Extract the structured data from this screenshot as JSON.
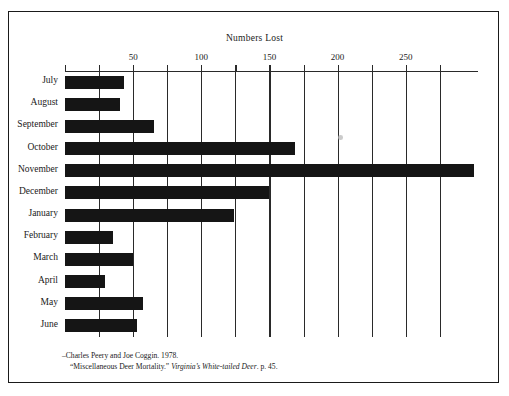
{
  "figure": {
    "frame_color": "#1a1a1a",
    "bar_color": "#151515",
    "axis_color": "#2a2a2a",
    "background": "#ffffff"
  },
  "citation": {
    "line1": "–Charles Peery and Joe Coggin.  1978.",
    "line2_pre": "“Miscellaneous Deer Mortality.” ",
    "line2_italic": "Virginia’s White-tailed Deer",
    "line2_post": ". p. 45."
  },
  "chart_data": {
    "type": "bar",
    "orientation": "horizontal",
    "title": "Numbers Lost",
    "xlabel": "Numbers Lost",
    "ylabel": "",
    "categories": [
      "July",
      "August",
      "September",
      "October",
      "November",
      "December",
      "January",
      "February",
      "March",
      "April",
      "May",
      "June"
    ],
    "values": [
      43,
      40,
      65,
      169,
      300,
      150,
      124,
      35,
      50,
      29,
      57,
      53
    ],
    "xlim": [
      0,
      303
    ],
    "tick_values": [
      0,
      25,
      50,
      75,
      100,
      125,
      150,
      175,
      200,
      225,
      250,
      275
    ],
    "tick_labels": [
      "",
      "",
      "50",
      "",
      "100",
      "",
      "150",
      "",
      "200",
      "",
      "250",
      ""
    ],
    "grid": true,
    "grid_axis": "x",
    "legend": false,
    "axis_position": "top"
  }
}
